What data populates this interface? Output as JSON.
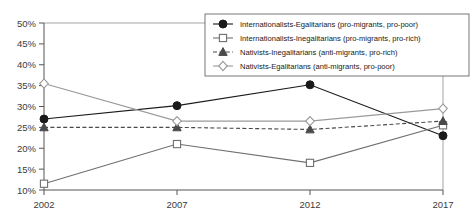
{
  "chart_data": {
    "type": "line",
    "title": "",
    "xlabel": "",
    "ylabel": "",
    "categories": [
      "2002",
      "2007",
      "2012",
      "2017"
    ],
    "ylim": [
      10,
      50
    ],
    "ytick_labels": [
      "50%",
      "45%",
      "40%",
      "35%",
      "30%",
      "25%",
      "20%",
      "15%",
      "10%"
    ],
    "ytick_values": [
      50,
      45,
      40,
      35,
      30,
      25,
      20,
      15,
      10
    ],
    "grid": false,
    "legend_position": "top-right",
    "series": [
      {
        "name": "Internationalists-Egalitarians (pro-migrants, pro-poor)",
        "marker": "filled-circle",
        "color": "#1a1a1a",
        "line_style": "solid",
        "values": [
          27.0,
          30.2,
          35.2,
          23.0
        ]
      },
      {
        "name": "Internationalists-Inegalitarians (pro-migrants, pro-rich)",
        "marker": "open-square",
        "color": "#6f6f6f",
        "line_style": "solid",
        "values": [
          11.5,
          21.0,
          16.5,
          25.5
        ]
      },
      {
        "name": "Nativists-Inegalitarians (anti-migrants, pro-rich)",
        "marker": "filled-triangle",
        "color": "#4a4a4a",
        "line_style": "dashed",
        "values": [
          25.0,
          25.0,
          24.5,
          26.5
        ]
      },
      {
        "name": "Nativists-Egalitarians (anti-migrants, pro-poor)",
        "marker": "open-diamond",
        "color": "#9a9a9a",
        "line_style": "solid",
        "values": [
          35.5,
          26.5,
          26.5,
          29.5
        ]
      }
    ]
  }
}
